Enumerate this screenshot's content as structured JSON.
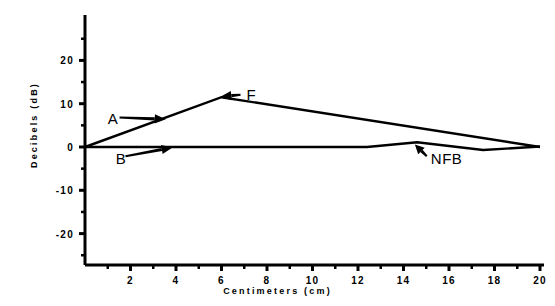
{
  "chart_data": {
    "type": "line",
    "title": "",
    "xlabel": "Centimeters (cm)",
    "ylabel": "Decibels (dB)",
    "xlim": [
      0,
      20
    ],
    "ylim": [
      -25,
      27
    ],
    "xticks": [
      2,
      4,
      6,
      8,
      10,
      12,
      14,
      16,
      18,
      20
    ],
    "xtick_labels": [
      "2",
      "4",
      "6",
      "8",
      "10",
      "12",
      "14",
      "16",
      "18",
      "20"
    ],
    "xminor_step": 1,
    "yticks": [
      20,
      10,
      0,
      -10,
      -20
    ],
    "ytick_labels": [
      "20",
      "10",
      "0",
      "-10",
      "-20"
    ],
    "yminor_step": 5,
    "grid": false,
    "legend": "none",
    "line_color": "#000000",
    "axis_color": "#000000",
    "background": "#ffffff",
    "series": [
      {
        "name": "A",
        "x": [
          0.0,
          6.0,
          20.0
        ],
        "y": [
          0.0,
          11.5,
          0.0
        ]
      },
      {
        "name": "B",
        "x": [
          0.0,
          12.4,
          14.6,
          17.5,
          20.0
        ],
        "y": [
          0.0,
          0.0,
          1.1,
          -0.7,
          0.1
        ]
      }
    ],
    "annotations": [
      {
        "label": "A",
        "text_x": 1.0,
        "text_y": 6.8,
        "point_x": 3.55,
        "point_y": 6.4,
        "arrow": "right"
      },
      {
        "label": "F",
        "text_x": 7.1,
        "text_y": 12.2,
        "point_x": 5.95,
        "point_y": 11.6,
        "arrow": "left"
      },
      {
        "label": "B",
        "text_x": 1.35,
        "text_y": -2.6,
        "point_x": 3.85,
        "point_y": -0.1,
        "arrow": "up-right"
      },
      {
        "label": "NFB",
        "text_x": 15.2,
        "text_y": -2.6,
        "point_x": 14.5,
        "point_y": 0.6,
        "arrow": "up-left"
      }
    ]
  }
}
